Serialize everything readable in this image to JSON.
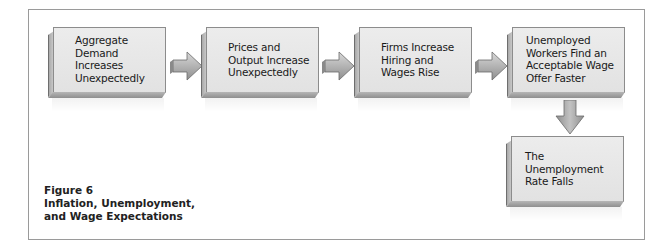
{
  "figure": {
    "number_label": "Figure 6",
    "title_line1": "Inflation, Unemployment,",
    "title_line2": "and Wage Expectations"
  },
  "flow": {
    "boxes": [
      {
        "id": "aggregate-demand",
        "text": "Aggregate\nDemand\nIncreases\nUnexpectedly"
      },
      {
        "id": "prices-output",
        "text": "Prices and\nOutput Increase\nUnexpectedly"
      },
      {
        "id": "firms-hiring",
        "text": "Firms Increase\nHiring and\nWages Rise"
      },
      {
        "id": "unemployed-workers",
        "text": "Unemployed\nWorkers Find an\nAcceptable Wage\nOffer Faster"
      },
      {
        "id": "unemployment-rate",
        "text": "The Unemployment\nRate Falls"
      }
    ],
    "arrows": [
      {
        "from": "aggregate-demand",
        "to": "prices-output",
        "direction": "right"
      },
      {
        "from": "prices-output",
        "to": "firms-hiring",
        "direction": "right"
      },
      {
        "from": "firms-hiring",
        "to": "unemployed-workers",
        "direction": "right"
      },
      {
        "from": "unemployed-workers",
        "to": "unemployment-rate",
        "direction": "down"
      }
    ]
  },
  "colors": {
    "box_face": "#e6e6e6",
    "box_border": "#8c8c8c",
    "arrow_fill": "#b0b0b0",
    "frame_border": "#9a9a9a",
    "text": "#1a1a1a"
  }
}
